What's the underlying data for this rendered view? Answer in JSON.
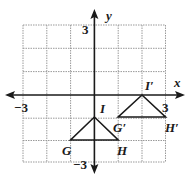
{
  "figure": {
    "axes": {
      "x_label": "x",
      "y_label": "y",
      "x_tick_left": "−3",
      "x_tick_right": "3",
      "y_tick_top": "3",
      "y_tick_bottom": "−3",
      "range": [
        -3,
        3
      ],
      "grid": true
    },
    "triangles": [
      {
        "name": "GHI",
        "vertices": [
          {
            "label": "G",
            "x": -1,
            "y": -2
          },
          {
            "label": "H",
            "x": 1,
            "y": -2
          },
          {
            "label": "I",
            "x": 0,
            "y": -1
          }
        ]
      },
      {
        "name": "G'H'I'",
        "vertices": [
          {
            "label": "G′",
            "x": 1,
            "y": -1
          },
          {
            "label": "H′",
            "x": 3,
            "y": -1
          },
          {
            "label": "I′",
            "x": 2,
            "y": 0
          }
        ]
      }
    ],
    "colors": {
      "grid": "#9a9a9a",
      "axis": "#1a1a1a",
      "shape": "#1a1a1a"
    }
  }
}
